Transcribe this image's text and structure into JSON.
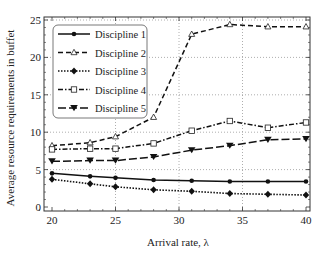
{
  "chart_data": {
    "type": "line",
    "title": "",
    "xlabel": "Arrival rate, λ",
    "ylabel": "Average resource requirements in buffet",
    "xlim": [
      19,
      40.5
    ],
    "ylim": [
      -0.5,
      25.5
    ],
    "xticks": [
      20,
      25,
      30,
      35,
      40
    ],
    "yticks": [
      0,
      5,
      10,
      15,
      20,
      25
    ],
    "grid": true,
    "legend_position": "upper left",
    "x": [
      20,
      23,
      25,
      28,
      31,
      34,
      37,
      40
    ],
    "series": [
      {
        "name": "Discipline 1",
        "values": [
          4.5,
          4.1,
          3.9,
          3.6,
          3.5,
          3.4,
          3.4,
          3.4
        ],
        "linestyle": "solid",
        "marker": "circle"
      },
      {
        "name": "Discipline 2",
        "values": [
          8.2,
          8.6,
          9.4,
          12.0,
          23.1,
          24.4,
          24.1,
          24.1
        ],
        "linestyle": "dashed",
        "marker": "triangle-open"
      },
      {
        "name": "Discipline 3",
        "values": [
          3.7,
          3.1,
          2.7,
          2.3,
          2.1,
          1.8,
          1.7,
          1.6
        ],
        "linestyle": "dotted",
        "marker": "diamond"
      },
      {
        "name": "Discipline 4",
        "values": [
          7.7,
          7.8,
          7.8,
          8.5,
          10.2,
          11.5,
          10.6,
          11.3
        ],
        "linestyle": "dashdot",
        "marker": "square-open"
      },
      {
        "name": "Discipline 5",
        "values": [
          6.1,
          6.2,
          6.2,
          6.7,
          7.6,
          8.2,
          9.0,
          9.1
        ],
        "linestyle": "longdash",
        "marker": "triangle-down"
      }
    ]
  }
}
